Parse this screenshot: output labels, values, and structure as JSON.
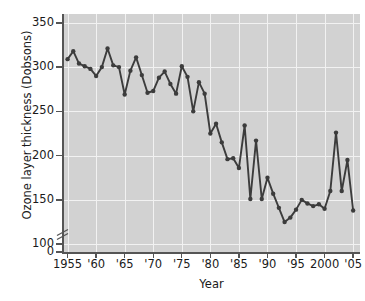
{
  "chart_data": {
    "type": "line",
    "title": "",
    "xlabel": "Year",
    "ylabel": "Ozone layer thickness (Dobsons)",
    "xlim": [
      1954.2,
      2006.2
    ],
    "ylim": [
      90,
      360
    ],
    "y_axis_broken": true,
    "y_break_between": [
      0,
      100
    ],
    "grid": true,
    "legend": null,
    "marker": "filled-circle",
    "line_color": "#3c3c3c",
    "plot_background": "#d2d2d2",
    "gridline_color": "#f2f2f2",
    "y_ticks": [
      0,
      100,
      150,
      200,
      250,
      300,
      350
    ],
    "y_tick_labels": [
      "0",
      "100",
      "150",
      "200",
      "250",
      "300",
      "350"
    ],
    "x_ticks": [
      1955,
      1960,
      1965,
      1970,
      1975,
      1980,
      1985,
      1990,
      1995,
      2000,
      2005
    ],
    "x_tick_labels": [
      "1955",
      "'60",
      "'65",
      "'70",
      "'75",
      "'80",
      "'85",
      "'90",
      "'95",
      "2000",
      "'05"
    ],
    "x": [
      1955,
      1956,
      1957,
      1958,
      1959,
      1960,
      1961,
      1962,
      1963,
      1964,
      1965,
      1966,
      1967,
      1968,
      1969,
      1970,
      1971,
      1972,
      1973,
      1974,
      1975,
      1976,
      1977,
      1978,
      1979,
      1980,
      1981,
      1982,
      1983,
      1984,
      1985,
      1986,
      1987,
      1988,
      1989,
      1990,
      1991,
      1992,
      1993,
      1994,
      1995,
      1996,
      1997,
      1998,
      1999,
      2000,
      2001,
      2002,
      2003,
      2004,
      2005
    ],
    "values": [
      309,
      318,
      304,
      301,
      298,
      290,
      300,
      321,
      302,
      300,
      269,
      296,
      311,
      291,
      271,
      273,
      288,
      295,
      281,
      270,
      301,
      289,
      250,
      283,
      270,
      225,
      236,
      215,
      196,
      197,
      186,
      234,
      151,
      217,
      151,
      175,
      157,
      141,
      125,
      130,
      139,
      150,
      146,
      143,
      145,
      140,
      160,
      226,
      160,
      195,
      138
    ]
  }
}
